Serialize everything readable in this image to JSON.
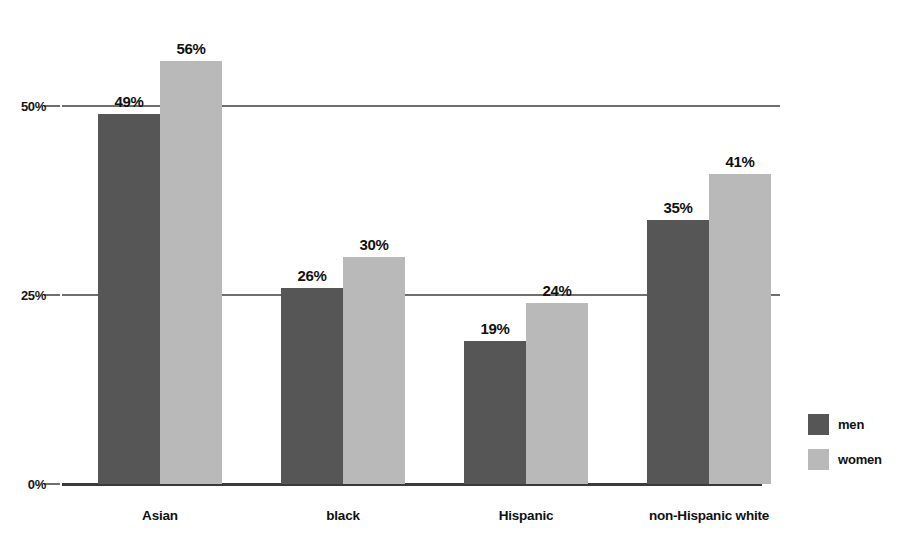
{
  "chart_data": {
    "type": "bar",
    "title": "",
    "subtitle": "",
    "xlabel": "",
    "ylabel": "",
    "categories": [
      "Asian",
      "black",
      "Hispanic",
      "non-Hispanic white"
    ],
    "series": [
      {
        "name": "men",
        "color": "#565656",
        "values": [
          49,
          26,
          19,
          35
        ],
        "labels": [
          "49%",
          "26%",
          "19%",
          "35%"
        ]
      },
      {
        "name": "women",
        "color": "#b9b9b9",
        "values": [
          56,
          30,
          24,
          41
        ],
        "labels": [
          "56%",
          "30%",
          "24%",
          "41%"
        ]
      }
    ],
    "ylim": [
      0,
      62.5
    ],
    "yticks": [
      0,
      25,
      50
    ],
    "ytick_labels": [
      "0%",
      "25%",
      "50%"
    ],
    "grid": true,
    "legend_position": "right",
    "value_labels": true,
    "units": "percent"
  },
  "legend": {
    "entries": [
      {
        "label": "men"
      },
      {
        "label": "women"
      }
    ]
  }
}
